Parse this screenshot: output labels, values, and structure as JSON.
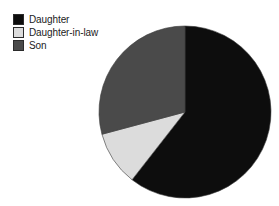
{
  "figure": {
    "background_color": "#ffffff",
    "width": 279,
    "height": 206
  },
  "legend": {
    "position": "top-left",
    "items": [
      {
        "label": "Daughter",
        "color": "#0d0d0d",
        "swatch_name": "legend-swatch-daughter"
      },
      {
        "label": "Daughter-in-law",
        "color": "#dcdcdc",
        "swatch_name": "legend-swatch-daughter-in-law"
      },
      {
        "label": "Son",
        "color": "#4a4a4a",
        "swatch_name": "legend-swatch-son"
      }
    ]
  },
  "chart_data": {
    "type": "pie",
    "title": "",
    "subtitle": "",
    "xlabel": "",
    "ylabel": "",
    "grid": false,
    "legend_position": "top-left",
    "start_angle_deg": 0,
    "direction": "clockwise",
    "center": {
      "cx": 185,
      "cy": 112
    },
    "radius": 86,
    "categories": [
      "Daughter",
      "Daughter-in-law",
      "Son"
    ],
    "values": [
      60.5,
      10.3,
      29.2
    ],
    "value_unit": "percent",
    "colors": [
      "#0d0d0d",
      "#dcdcdc",
      "#4a4a4a"
    ],
    "slices": [
      {
        "label": "Daughter",
        "value": 60.5,
        "angle_deg": 218,
        "start_deg": 0,
        "end_deg": 218,
        "color": "#0d0d0d"
      },
      {
        "label": "Daughter-in-law",
        "value": 10.3,
        "angle_deg": 37,
        "start_deg": 218,
        "end_deg": 255,
        "color": "#dcdcdc"
      },
      {
        "label": "Son",
        "value": 29.2,
        "angle_deg": 105,
        "start_deg": 255,
        "end_deg": 360,
        "color": "#4a4a4a"
      }
    ],
    "data_labels_shown": false,
    "annotations": []
  }
}
